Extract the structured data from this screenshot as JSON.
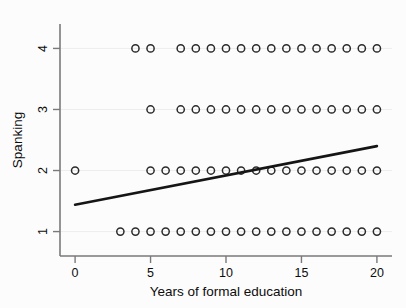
{
  "chart_data": {
    "type": "scatter",
    "title": "",
    "xlabel": "Years of formal education",
    "ylabel": "Spanking",
    "xlim": [
      -1,
      21
    ],
    "ylim": [
      0.6,
      4.4
    ],
    "xticks": [
      0,
      5,
      10,
      15,
      20
    ],
    "xtick_labels": [
      "0",
      "5",
      "10",
      "15",
      "20"
    ],
    "yticks": [
      1,
      2,
      3,
      4
    ],
    "ytick_labels": [
      "1",
      "2",
      "3",
      "4"
    ],
    "grid": false,
    "legend": "none",
    "marker": "open-circle",
    "series": [
      {
        "name": "Spanking by education",
        "points": [
          {
            "x": 0,
            "y": 2
          },
          {
            "x": 3,
            "y": 1
          },
          {
            "x": 4,
            "y": 1
          },
          {
            "x": 5,
            "y": 1
          },
          {
            "x": 6,
            "y": 1
          },
          {
            "x": 7,
            "y": 1
          },
          {
            "x": 8,
            "y": 1
          },
          {
            "x": 9,
            "y": 1
          },
          {
            "x": 10,
            "y": 1
          },
          {
            "x": 11,
            "y": 1
          },
          {
            "x": 12,
            "y": 1
          },
          {
            "x": 13,
            "y": 1
          },
          {
            "x": 14,
            "y": 1
          },
          {
            "x": 15,
            "y": 1
          },
          {
            "x": 16,
            "y": 1
          },
          {
            "x": 17,
            "y": 1
          },
          {
            "x": 18,
            "y": 1
          },
          {
            "x": 19,
            "y": 1
          },
          {
            "x": 20,
            "y": 1
          },
          {
            "x": 5,
            "y": 2
          },
          {
            "x": 6,
            "y": 2
          },
          {
            "x": 7,
            "y": 2
          },
          {
            "x": 8,
            "y": 2
          },
          {
            "x": 9,
            "y": 2
          },
          {
            "x": 10,
            "y": 2
          },
          {
            "x": 11,
            "y": 2
          },
          {
            "x": 12,
            "y": 2
          },
          {
            "x": 13,
            "y": 2
          },
          {
            "x": 14,
            "y": 2
          },
          {
            "x": 15,
            "y": 2
          },
          {
            "x": 16,
            "y": 2
          },
          {
            "x": 17,
            "y": 2
          },
          {
            "x": 18,
            "y": 2
          },
          {
            "x": 19,
            "y": 2
          },
          {
            "x": 20,
            "y": 2
          },
          {
            "x": 5,
            "y": 3
          },
          {
            "x": 7,
            "y": 3
          },
          {
            "x": 8,
            "y": 3
          },
          {
            "x": 9,
            "y": 3
          },
          {
            "x": 10,
            "y": 3
          },
          {
            "x": 11,
            "y": 3
          },
          {
            "x": 12,
            "y": 3
          },
          {
            "x": 13,
            "y": 3
          },
          {
            "x": 14,
            "y": 3
          },
          {
            "x": 15,
            "y": 3
          },
          {
            "x": 16,
            "y": 3
          },
          {
            "x": 17,
            "y": 3
          },
          {
            "x": 18,
            "y": 3
          },
          {
            "x": 19,
            "y": 3
          },
          {
            "x": 20,
            "y": 3
          },
          {
            "x": 4,
            "y": 4
          },
          {
            "x": 5,
            "y": 4
          },
          {
            "x": 7,
            "y": 4
          },
          {
            "x": 8,
            "y": 4
          },
          {
            "x": 9,
            "y": 4
          },
          {
            "x": 10,
            "y": 4
          },
          {
            "x": 11,
            "y": 4
          },
          {
            "x": 12,
            "y": 4
          },
          {
            "x": 13,
            "y": 4
          },
          {
            "x": 14,
            "y": 4
          },
          {
            "x": 15,
            "y": 4
          },
          {
            "x": 16,
            "y": 4
          },
          {
            "x": 17,
            "y": 4
          },
          {
            "x": 18,
            "y": 4
          },
          {
            "x": 19,
            "y": 4
          },
          {
            "x": 20,
            "y": 4
          }
        ]
      }
    ],
    "fit_line": {
      "name": "linear fit",
      "x_start": 0,
      "y_start": 1.44,
      "x_end": 20,
      "y_end": 2.4,
      "color": "#151515"
    },
    "colors": {
      "marker_stroke": "#2b2b2b",
      "fit_line": "#151515",
      "axis": "#7a7a7a",
      "background": "#fcfcfc",
      "text": "#0d0d0d"
    }
  }
}
